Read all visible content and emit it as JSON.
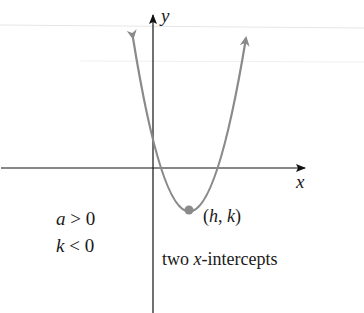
{
  "diagram": {
    "type": "parabola-graph",
    "axes": {
      "x_label": "x",
      "y_label": "y"
    },
    "vertex_label": "(h, k)",
    "vertex_parts": {
      "open": "(",
      "h": "h",
      "sep": ", ",
      "k": "k",
      "close": ")"
    },
    "conditions": [
      {
        "var": "a",
        "op": ">",
        "value": "0"
      },
      {
        "var": "k",
        "op": "<",
        "value": "0"
      }
    ],
    "caption": {
      "prefix": "two ",
      "var": "x",
      "suffix": "-intercepts"
    },
    "colors": {
      "curve": "#8a8a8a",
      "axis": "#111111",
      "vertex": "#8a8a8a",
      "guide": "#e6e6e6"
    }
  }
}
